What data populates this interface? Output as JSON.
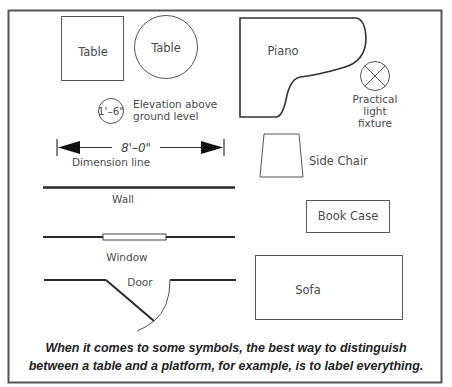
{
  "diagram": {
    "symbols": {
      "square_table": {
        "label": "Table"
      },
      "round_table": {
        "label": "Table"
      },
      "piano": {
        "label": "Piano"
      },
      "light_fixture": {
        "label_line1": "Practical",
        "label_line2": "light",
        "label_line3": "fixture"
      },
      "elevation": {
        "value": "1'–6\"",
        "label_line1": "Elevation above",
        "label_line2": "ground level"
      },
      "dimension_line": {
        "value": "8'–0\"",
        "label": "Dimension line"
      },
      "side_chair": {
        "label": "Side Chair"
      },
      "wall": {
        "label": "Wall"
      },
      "book_case": {
        "label": "Book Case"
      },
      "window": {
        "label": "Window"
      },
      "sofa": {
        "label": "Sofa"
      },
      "door": {
        "label": "Door"
      }
    },
    "caption": {
      "line1": "When it comes to some symbols, the best way to distinguish",
      "line2": "between a table and a platform, for example, is to label everything."
    }
  }
}
